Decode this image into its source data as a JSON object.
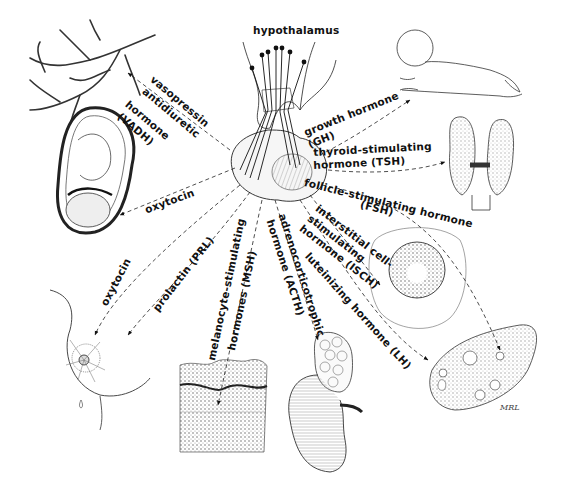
{
  "diagram": {
    "title": "hypothalamus",
    "center_structure": "pituitary gland",
    "labels": {
      "vadh_l1": "vasopressin",
      "vadh_l2": "antidiuretic",
      "vadh_l3": "hormone",
      "vadh_l4": "(VADH)",
      "oxytocin_uterus": "oxytocin",
      "oxytocin_breast": "oxytocin",
      "prolactin": "prolactin (PRL)",
      "msh_l1": "melanocyte-stimulating",
      "msh_l2": "hormones (MSH)",
      "acth_l1": "adrenocorticotrophic",
      "acth_l2": "hormone (ACTH)",
      "lh": "luteinizing hormone (LH)",
      "isch_l1": "interstitial cell-",
      "isch_l2": "stimulating",
      "isch_l3": "hormone (ISCH)",
      "fsh_l1": "follicle-stimulating hormone",
      "fsh_l2": "(FSH)",
      "tsh_l1": "thyroid-stimulating",
      "tsh_l2": "hormone (TSH)",
      "gh_l1": "growth hormone",
      "gh_l2": "(GH)"
    },
    "targets": [
      "kidney tubules",
      "uterus with fetus",
      "breast",
      "skin",
      "adrenal gland and kidney",
      "ovary",
      "testis",
      "thyroid gland",
      "infant (growth)"
    ],
    "signature": "MRL"
  }
}
